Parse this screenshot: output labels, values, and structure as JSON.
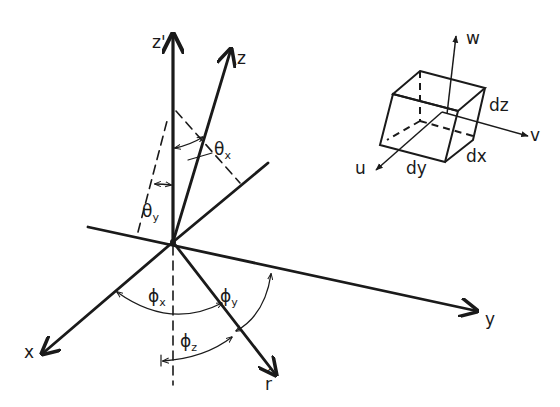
{
  "diagram": {
    "main_axes": {
      "z_prime": "z'",
      "z": "z",
      "x": "x",
      "y": "y",
      "r_hat": "r",
      "r_hat_accent": "^"
    },
    "angles": {
      "theta_x": {
        "symbol": "θ",
        "sub": "x"
      },
      "theta_y": {
        "symbol": "θ",
        "sub": "y"
      },
      "phi_x": {
        "symbol": "ϕ",
        "sub": "x"
      },
      "phi_y": {
        "symbol": "ϕ",
        "sub": "y"
      },
      "phi_z": {
        "symbol": "ϕ",
        "sub": "z"
      }
    },
    "volume_element": {
      "axes": {
        "u": "u",
        "v": "v",
        "w": "w"
      },
      "dimensions": {
        "dx": "dx",
        "dy": "dy",
        "dz": "dz"
      }
    },
    "colors": {
      "ink": "#1a1a1a",
      "background": "#ffffff"
    }
  }
}
